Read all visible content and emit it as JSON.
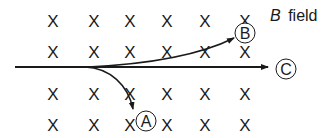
{
  "diagram": {
    "field_label": {
      "symbol": "B",
      "word": "field"
    },
    "field_marker": {
      "glyph": "X",
      "meaning": "field into page",
      "columns_x": [
        53,
        94,
        130,
        167,
        205,
        245
      ],
      "rows_y": [
        27,
        58,
        100,
        131
      ]
    },
    "trajectories": {
      "A": {
        "label": "A",
        "description": "curves downward"
      },
      "B": {
        "label": "B",
        "description": "curves upward"
      },
      "C": {
        "label": "C",
        "description": "straight line"
      }
    },
    "colors": {
      "ink": "#1a1a1a",
      "background": "#ffffff"
    }
  }
}
